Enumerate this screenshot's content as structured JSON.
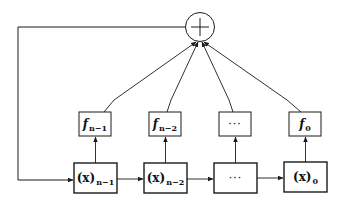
{
  "diagram": {
    "type": "shift-register-sum",
    "sum_node": {
      "symbol": "+"
    },
    "f_boxes": [
      {
        "base": "f",
        "sub": "n−1"
      },
      {
        "base": "f",
        "sub": "n−2"
      },
      {
        "base": "",
        "sub": "",
        "ellipsis": "···"
      },
      {
        "base": "f",
        "sub": "0"
      }
    ],
    "x_boxes": [
      {
        "base": "(x)",
        "sub": "n−1"
      },
      {
        "base": "(x)",
        "sub": "n−2"
      },
      {
        "base": "",
        "sub": "",
        "ellipsis": "···"
      },
      {
        "base": "(x)",
        "sub": "0"
      }
    ],
    "colors": {
      "stroke": "#1a1a1a",
      "background": "#ffffff"
    }
  }
}
